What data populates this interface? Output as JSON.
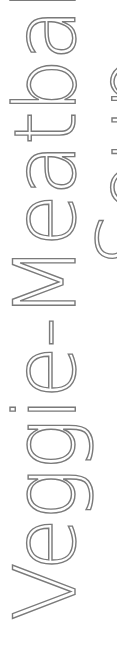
{
  "title": {
    "line1": "Veggie-Meatball",
    "line2": "Soup"
  },
  "colors": {
    "text_stroke": "#7a7a7a",
    "background": "#ffffff"
  }
}
